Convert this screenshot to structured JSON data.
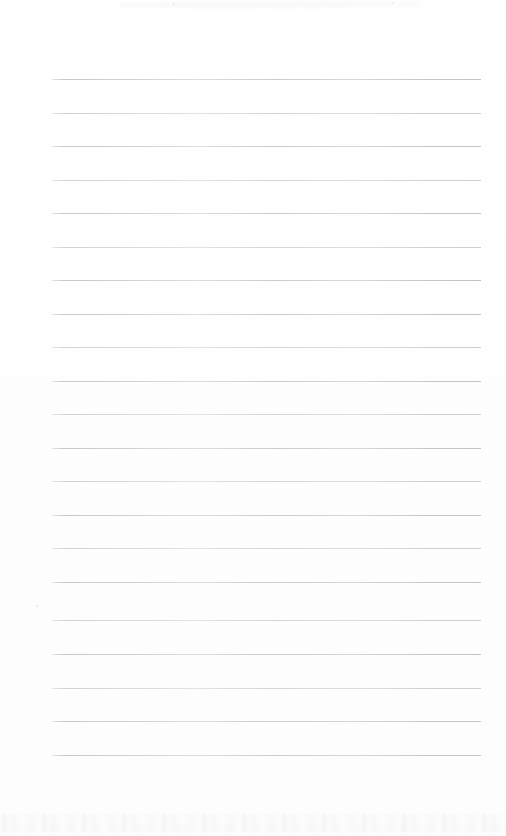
{
  "document": {
    "kind": "scanned-ruled-notepad-page",
    "title": "Blank ruled notepad page",
    "content_text": "",
    "background_color": "#ffffff",
    "rule_color": "#c8c9cf",
    "page_width": 506,
    "page_height": 836
  },
  "ruling": {
    "line_count": 21,
    "first_line_y": 79,
    "line_spacing": 33.5,
    "line_left_x": 52,
    "line_right_x": 481,
    "line_thickness": 1,
    "lines": [
      {
        "index": 1,
        "y": 79,
        "weight": "darker"
      },
      {
        "index": 2,
        "y": 113,
        "weight": "lighter"
      },
      {
        "index": 3,
        "y": 146,
        "weight": "darker"
      },
      {
        "index": 4,
        "y": 180,
        "weight": "lighter"
      },
      {
        "index": 5,
        "y": 213,
        "weight": "darker"
      },
      {
        "index": 6,
        "y": 247,
        "weight": "lighter"
      },
      {
        "index": 7,
        "y": 280,
        "weight": "darker"
      },
      {
        "index": 8,
        "y": 314,
        "weight": "darker"
      },
      {
        "index": 9,
        "y": 347,
        "weight": "lighter"
      },
      {
        "index": 10,
        "y": 381,
        "weight": "darker"
      },
      {
        "index": 11,
        "y": 414,
        "weight": "lighter"
      },
      {
        "index": 12,
        "y": 448,
        "weight": "darker"
      },
      {
        "index": 13,
        "y": 481,
        "weight": "lighter"
      },
      {
        "index": 14,
        "y": 515,
        "weight": "darker"
      },
      {
        "index": 15,
        "y": 548,
        "weight": "lighter"
      },
      {
        "index": 16,
        "y": 582,
        "weight": "darker"
      },
      {
        "index": 17,
        "y": 620,
        "weight": "lighter"
      },
      {
        "index": 18,
        "y": 654,
        "weight": "darker"
      },
      {
        "index": 19,
        "y": 688,
        "weight": "lighter"
      },
      {
        "index": 20,
        "y": 721,
        "weight": "darker"
      },
      {
        "index": 21,
        "y": 755,
        "weight": "darker"
      }
    ]
  },
  "artifacts": {
    "noise_bands": [
      {
        "name": "bottom-noise-band-primary",
        "y": 814,
        "variant": "band-one"
      },
      {
        "name": "bottom-noise-band-secondary",
        "y": 824,
        "variant": "band-two"
      }
    ],
    "specks": [
      {
        "x": 36,
        "y": 605,
        "size": 2
      },
      {
        "x": 173,
        "y": 3,
        "size": 2
      },
      {
        "x": 392,
        "y": 2,
        "size": 2
      }
    ],
    "top_smudge": {
      "x": 120,
      "y": 0,
      "width": 300,
      "height": 10
    }
  }
}
